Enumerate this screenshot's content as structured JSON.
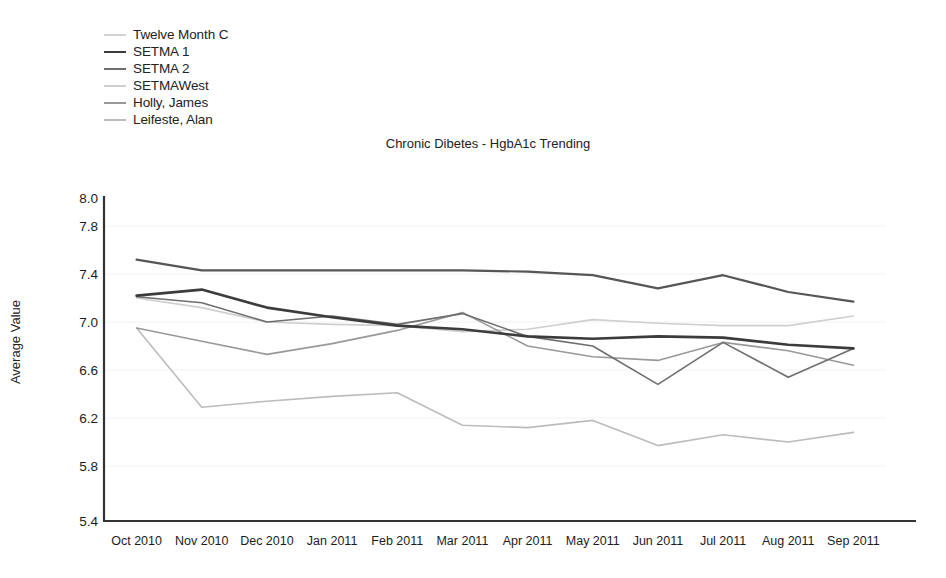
{
  "chart_data": {
    "type": "line",
    "title": "Chronic Dibetes - HgbA1c Trending",
    "xlabel": "",
    "ylabel": "Average Value",
    "ylim": [
      5.4,
      8.0
    ],
    "yticks": [
      8.0,
      7.8,
      7.4,
      7.0,
      6.6,
      6.2,
      5.8,
      5.4
    ],
    "ytick_labels": [
      "8.0",
      "7.8",
      "7.4",
      "7.0",
      "6.6",
      "6.2",
      "5.8",
      "5.4"
    ],
    "grid": false,
    "legend_position": "top-left-outside",
    "categories": [
      "Oct 2010",
      "Nov 2010",
      "Dec 2010",
      "Jan 2011",
      "Feb 2011",
      "Mar 2011",
      "Apr 2011",
      "May 2011",
      "Jun 2011",
      "Jul 2011",
      "Aug 2011",
      "Sep 2011"
    ],
    "series": [
      {
        "name": "Twelve Month C",
        "color": "#d2d2d2",
        "line_color": "#565656",
        "width": 2.2,
        "values": [
          7.52,
          7.43,
          7.43,
          7.43,
          7.43,
          7.43,
          7.42,
          7.39,
          7.28,
          7.39,
          7.25,
          7.17
        ]
      },
      {
        "name": "SETMA 1",
        "color": "#3c3c3c",
        "line_color": "#3c3c3c",
        "width": 2.6,
        "values": [
          7.22,
          7.27,
          7.12,
          7.04,
          6.97,
          6.94,
          6.88,
          6.86,
          6.88,
          6.87,
          6.81,
          6.78
        ]
      },
      {
        "name": "SETMA 2",
        "color": "#6e6e6e",
        "line_color": "#6e6e6e",
        "width": 1.6,
        "values": [
          7.21,
          7.16,
          7.0,
          7.05,
          6.98,
          7.07,
          6.88,
          6.8,
          6.48,
          6.83,
          6.54,
          6.78
        ]
      },
      {
        "name": "SETMAWest",
        "color": "#cfcfcf",
        "line_color": "#cfcfcf",
        "width": 1.6,
        "values": [
          7.2,
          7.12,
          7.0,
          6.98,
          6.97,
          6.92,
          6.94,
          7.02,
          6.99,
          6.97,
          6.97,
          7.05
        ]
      },
      {
        "name": "Holly, James",
        "color": "#999999",
        "line_color": "#999999",
        "width": 1.6,
        "values": [
          6.95,
          6.84,
          6.73,
          6.82,
          6.93,
          7.08,
          6.8,
          6.71,
          6.68,
          6.83,
          6.76,
          6.64
        ]
      },
      {
        "name": "Leifeste, Alan",
        "color": "#bcbcbc",
        "line_color": "#bcbcbc",
        "width": 1.6,
        "values": [
          6.95,
          6.29,
          6.34,
          6.38,
          6.41,
          6.14,
          6.12,
          6.18,
          5.97,
          6.06,
          6.0,
          6.08
        ]
      }
    ]
  },
  "legend": {
    "items": [
      {
        "label": "Twelve Month C"
      },
      {
        "label": "SETMA 1"
      },
      {
        "label": "SETMA 2"
      },
      {
        "label": "SETMAWest"
      },
      {
        "label": "Holly, James"
      },
      {
        "label": "Leifeste, Alan"
      }
    ]
  }
}
